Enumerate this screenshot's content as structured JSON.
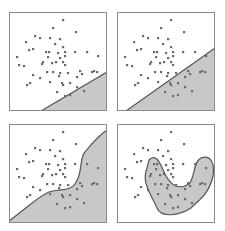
{
  "figure": {
    "colors": {
      "background": "#ffffff",
      "frame": "#8a8a8a",
      "region_fill": "#c8c8c8",
      "boundary": "#555555",
      "point": "#6a6a6a"
    },
    "panels": [
      {
        "id": "top-left",
        "boundary_type": "linear-shallow",
        "x": 9,
        "y": 12,
        "region_path": "M32,99 L98,60 L98,99 Z",
        "boundary_path": "M32,99 L98,60"
      },
      {
        "id": "top-right",
        "boundary_type": "linear-steep",
        "x": 117,
        "y": 12,
        "region_path": "M9,99 L98,36 L98,99 Z",
        "boundary_path": "M9,99 L98,36"
      },
      {
        "id": "bottom-left",
        "boundary_type": "curved",
        "x": 9,
        "y": 124,
        "region_path": "M0,97 C20,82 30,72 40,68 C52,64 60,68 66,60 C74,50 70,34 76,28 C84,18 92,10 98,6 L98,99 L0,99 Z",
        "boundary_path": "M0,97 C20,82 30,72 40,68 C52,64 60,68 66,60 C74,50 70,34 76,28 C84,18 92,10 98,6"
      },
      {
        "id": "bottom-right",
        "boundary_type": "closed-blob",
        "x": 117,
        "y": 124,
        "region_path": "M32,36 C40,28 44,42 48,50 C54,62 62,66 72,60 C78,54 76,38 84,34 C94,30 98,40 96,52 C92,70 82,76 74,84 C62,92 44,94 40,84 C34,70 24,58 30,44 Z",
        "boundary_path": "M32,36 C40,28 44,42 48,50 C54,62 62,66 72,60 C78,54 76,38 84,34 C94,30 98,40 96,52 C92,70 82,76 74,84 C62,92 44,94 40,84 C34,70 24,58 30,44 Z"
      }
    ],
    "points": [
      [
        54,
        8
      ],
      [
        44,
        16
      ],
      [
        67,
        20
      ],
      [
        26,
        24
      ],
      [
        31,
        26
      ],
      [
        17,
        30
      ],
      [
        41,
        26
      ],
      [
        51,
        27
      ],
      [
        46,
        32
      ],
      [
        54,
        35
      ],
      [
        24,
        37
      ],
      [
        20,
        38
      ],
      [
        37,
        40
      ],
      [
        40,
        40
      ],
      [
        49,
        41
      ],
      [
        56,
        40
      ],
      [
        66,
        40
      ],
      [
        78,
        40
      ],
      [
        8,
        45
      ],
      [
        39,
        45
      ],
      [
        56,
        44
      ],
      [
        51,
        46
      ],
      [
        89,
        44
      ],
      [
        34,
        50
      ],
      [
        43,
        51
      ],
      [
        47,
        50
      ],
      [
        54,
        50
      ],
      [
        15,
        54
      ],
      [
        10,
        53
      ],
      [
        33,
        52
      ],
      [
        56,
        53
      ],
      [
        38,
        60
      ],
      [
        44,
        60
      ],
      [
        51,
        61
      ],
      [
        59,
        61
      ],
      [
        71,
        59
      ],
      [
        83,
        60
      ],
      [
        88,
        60
      ],
      [
        24,
        63
      ],
      [
        31,
        66
      ],
      [
        50,
        64
      ],
      [
        41,
        70
      ],
      [
        68,
        65
      ],
      [
        21,
        71
      ],
      [
        18,
        73
      ],
      [
        53,
        71
      ],
      [
        54,
        73
      ],
      [
        61,
        71
      ],
      [
        68,
        75
      ],
      [
        48,
        80
      ],
      [
        56,
        84
      ],
      [
        61,
        83
      ],
      [
        75,
        79
      ],
      [
        85,
        59
      ],
      [
        73,
        62
      ]
    ]
  }
}
